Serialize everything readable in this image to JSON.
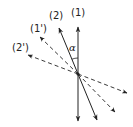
{
  "diagram": {
    "colors": {
      "ink": "#222222",
      "background": "#ffffff"
    },
    "center": {
      "x": 78,
      "y": 74
    },
    "rays": [
      {
        "id": "ray-1",
        "label": "(1)",
        "style": "solid",
        "tip": {
          "x": 78,
          "y": 27
        },
        "tail": {
          "x": 78,
          "y": 121
        }
      },
      {
        "id": "ray-2",
        "label": "(2)",
        "style": "solid",
        "tip": {
          "x": 59,
          "y": 28
        },
        "tail": {
          "x": 97,
          "y": 120
        }
      },
      {
        "id": "ray-1-prime",
        "label": "(1')",
        "style": "dashed",
        "tip": {
          "x": 40,
          "y": 37
        },
        "tail": {
          "x": 115,
          "y": 112
        }
      },
      {
        "id": "ray-2-prime",
        "label": "(2')",
        "style": "dashed",
        "tip": {
          "x": 28,
          "y": 55
        },
        "tail": {
          "x": 127,
          "y": 93
        }
      }
    ],
    "labels": {
      "ray1": "(1)",
      "ray2": "(2)",
      "ray1prime": "(1')",
      "ray2prime": "(2')",
      "angle": "α"
    }
  }
}
